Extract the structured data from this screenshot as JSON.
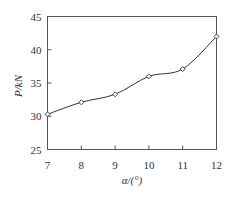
{
  "chart_data": {
    "type": "line",
    "title": "",
    "xlabel": "α/(°)",
    "ylabel": "P/kN",
    "x": [
      7,
      8,
      9,
      10,
      11,
      12
    ],
    "series": [
      {
        "name": "P",
        "values": [
          30.3,
          32.1,
          33.3,
          36.0,
          37.1,
          42.0
        ]
      }
    ],
    "xlim": [
      7,
      12
    ],
    "ylim": [
      25,
      45
    ],
    "xticks": [
      "7",
      "8",
      "9",
      "10",
      "11",
      "12"
    ],
    "yticks": [
      "25",
      "30",
      "35",
      "40",
      "45"
    ],
    "grid": false,
    "legend": null,
    "marker": "open-diamond",
    "colors": {
      "line": "#333333",
      "axes": "#555555"
    }
  }
}
